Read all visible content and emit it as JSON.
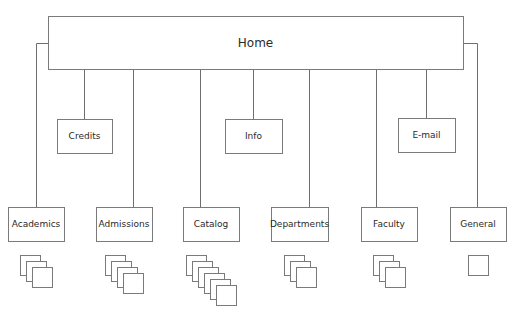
{
  "diagram": {
    "type": "site-map",
    "colors": {
      "stroke": "#7a7a7a",
      "text": "#2a2a2a",
      "background": "#ffffff"
    },
    "root": {
      "label": "Home",
      "x": 48,
      "y": 16,
      "w": 415,
      "h": 53
    },
    "utility_nodes": [
      {
        "label": "Credits",
        "x": 57,
        "y": 119,
        "w": 55,
        "h": 34,
        "link_x": 84
      },
      {
        "label": "Info",
        "x": 225,
        "y": 119,
        "w": 57,
        "h": 34,
        "link_x": 253
      },
      {
        "label": "E-mail",
        "x": 398,
        "y": 118,
        "w": 57,
        "h": 34,
        "link_x": 426
      }
    ],
    "section_nodes": [
      {
        "label": "Academics",
        "x": 8,
        "y": 207,
        "w": 56,
        "h": 34,
        "link_x": 36,
        "pages": 3
      },
      {
        "label": "Admissions",
        "x": 96,
        "y": 207,
        "w": 56,
        "h": 34,
        "link_x": 133,
        "pages": 4
      },
      {
        "label": "Catalog",
        "x": 183,
        "y": 207,
        "w": 56,
        "h": 34,
        "link_x": 200,
        "pages": 6
      },
      {
        "label": "Departments",
        "x": 271,
        "y": 207,
        "w": 57,
        "h": 34,
        "link_x": 309,
        "pages": 3
      },
      {
        "label": "Faculty",
        "x": 361,
        "y": 207,
        "w": 56,
        "h": 34,
        "link_x": 376,
        "pages": 3
      },
      {
        "label": "General",
        "x": 450,
        "y": 207,
        "w": 56,
        "h": 34,
        "link_x": 477,
        "pages": 1
      }
    ]
  }
}
